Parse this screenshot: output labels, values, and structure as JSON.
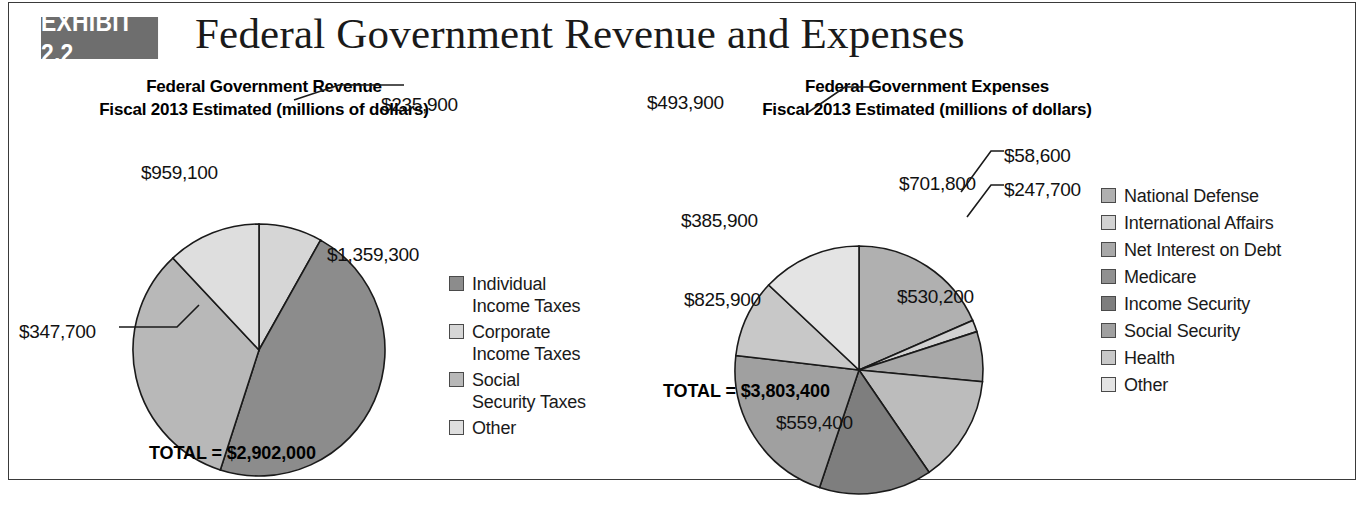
{
  "exhibit": {
    "badge": "EXHIBIT 2.2",
    "title": "Federal Government Revenue and Expenses"
  },
  "colors": {
    "dark_gray": "#8c8c8c",
    "mid_gray": "#a8a8a8",
    "light_gray": "#c4c4c4",
    "lighter_gray": "#d6d6d6",
    "lightest_gray": "#e8e8e8",
    "outline": "#1a1a1a",
    "badge_bg": "#6e6e6e",
    "frame_border": "#3a3a3a"
  },
  "revenue": {
    "heading_line1": "Federal Government Revenue",
    "heading_line2": "Fiscal 2013 Estimated (millions of dollars)",
    "total_label": "TOTAL = $2,902,000",
    "legend": [
      {
        "label": "Individual\nIncome Taxes",
        "color": "#8c8c8c"
      },
      {
        "label": "Corporate\nIncome Taxes",
        "color": "#d6d6d6"
      },
      {
        "label": "Social\nSecurity Taxes",
        "color": "#b8b8b8"
      },
      {
        "label": "Other",
        "color": "#dedede"
      }
    ]
  },
  "expenses": {
    "heading_line1": "Federal Government Expenses",
    "heading_line2": "Fiscal 2013 Estimated (millions of dollars)",
    "total_label": "TOTAL = $3,803,400",
    "legend": [
      {
        "label": "National Defense",
        "color": "#b0b0b0"
      },
      {
        "label": "International Affairs",
        "color": "#d2d2d2"
      },
      {
        "label": "Net Interest on Debt",
        "color": "#a8a8a8"
      },
      {
        "label": "Medicare",
        "color": "#909090"
      },
      {
        "label": "Income Security",
        "color": "#7e7e7e"
      },
      {
        "label": "Social Security",
        "color": "#a0a0a0"
      },
      {
        "label": "Health",
        "color": "#c8c8c8"
      },
      {
        "label": "Other",
        "color": "#e4e4e4"
      }
    ]
  },
  "chart_data": [
    {
      "type": "pie",
      "id": "revenue-pie",
      "title": "Federal Government Revenue",
      "subtitle": "Fiscal 2013 Estimated (millions of dollars)",
      "units": "millions of dollars",
      "total": 2902000,
      "total_label": "TOTAL = $2,902,000",
      "legend_position": "right",
      "center": {
        "x": 250,
        "y": 285
      },
      "radius": 126,
      "start_angle_deg": 0,
      "slices": [
        {
          "name": "Corporate Income Taxes",
          "value": 235900,
          "label": "$235,900",
          "color": "#d6d6d6",
          "label_mode": "callout",
          "label_x": 372,
          "label_y": 40,
          "leader": "M 285,35 L 330,20 L 395,20"
        },
        {
          "name": "Individual Income Taxes",
          "value": 1359300,
          "label": "$1,359,300",
          "color": "#8c8c8c",
          "label_mode": "inside",
          "label_x": 318,
          "label_y": 190
        },
        {
          "name": "Social Security Taxes",
          "value": 959100,
          "label": "$959,100",
          "color": "#b8b8b8",
          "label_mode": "inside",
          "label_x": 132,
          "label_y": 108
        },
        {
          "name": "Other",
          "value": 347700,
          "label": "$347,700",
          "color": "#dedede",
          "label_mode": "callout",
          "label_x": 10,
          "label_y": 267,
          "leader": "M 190,240 L 168,262 L 110,262"
        }
      ]
    },
    {
      "type": "pie",
      "id": "expenses-pie",
      "title": "Federal Government Expenses",
      "subtitle": "Fiscal 2013 Estimated (millions of dollars)",
      "units": "millions of dollars",
      "total": 3803400,
      "total_label": "TOTAL = $3,803,400",
      "legend_position": "right",
      "center": {
        "x": 250,
        "y": 305
      },
      "radius": 124,
      "start_angle_deg": 0,
      "slices": [
        {
          "name": "National Defense",
          "value": 701800,
          "label": "$701,800",
          "color": "#b0b0b0",
          "label_mode": "inside",
          "label_x": 290,
          "label_y": 119
        },
        {
          "name": "International Affairs",
          "value": 58600,
          "label": "$58,600",
          "color": "#d2d2d2",
          "label_mode": "callout",
          "label_x": 395,
          "label_y": 91,
          "leader": "M 352,127 L 382,86 L 395,86"
        },
        {
          "name": "Net Interest on Debt",
          "value": 247700,
          "label": "$247,700",
          "color": "#a8a8a8",
          "label_mode": "callout",
          "label_x": 395,
          "label_y": 125,
          "leader": "M 358,152 L 382,120 L 395,120"
        },
        {
          "name": "Medicare",
          "value": 530200,
          "label": "$530,200",
          "color": "#bcbcbc",
          "label_mode": "inside",
          "label_x": 288,
          "label_y": 232
        },
        {
          "name": "Income Security",
          "value": 559400,
          "label": "$559,400",
          "color": "#7e7e7e",
          "label_mode": "inside",
          "label_x": 167,
          "label_y": 358
        },
        {
          "name": "Social Security",
          "value": 825900,
          "label": "$825,900",
          "color": "#a0a0a0",
          "label_mode": "inside",
          "label_x": 75,
          "label_y": 235
        },
        {
          "name": "Health",
          "value": 385900,
          "label": "$385,900",
          "color": "#c8c8c8",
          "label_mode": "inside",
          "label_x": 72,
          "label_y": 156
        },
        {
          "name": "Other",
          "value": 493900,
          "label": "$493,900",
          "color": "#e4e4e4",
          "label_mode": "callout",
          "label_x": 38,
          "label_y": 38,
          "leader": "M 198,48 L 236,22 L 268,22"
        }
      ]
    }
  ]
}
